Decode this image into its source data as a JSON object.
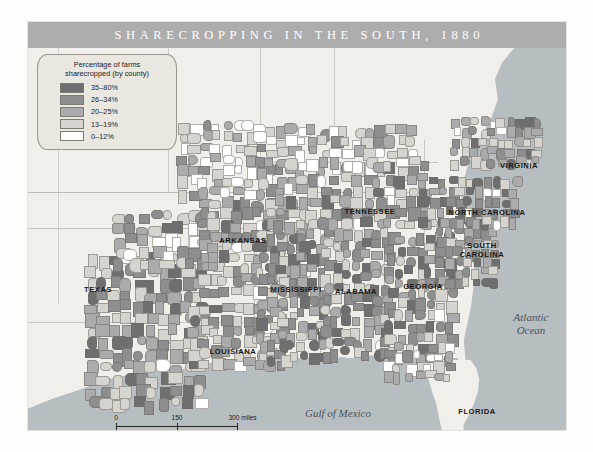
{
  "map": {
    "title": "SHARECROPPING IN THE SOUTH, 1880",
    "legend": {
      "title_line1": "Percentage of farms",
      "title_line2": "sharecropped (by county)",
      "entries": [
        {
          "label": "35–80%",
          "color": "#6f6f6f"
        },
        {
          "label": "26–34%",
          "color": "#8e8e8e"
        },
        {
          "label": "20–25%",
          "color": "#ababab"
        },
        {
          "label": "13–19%",
          "color": "#d6d4ce"
        },
        {
          "label": "0–12%",
          "color": "#ffffff"
        }
      ]
    },
    "state_labels": [
      {
        "name": "texas",
        "text": "TEXAS",
        "x": 70,
        "y": 268
      },
      {
        "name": "arkansas",
        "text": "ARKANSAS",
        "x": 215,
        "y": 219
      },
      {
        "name": "louisiana",
        "text": "LOUISIANA",
        "x": 205,
        "y": 330
      },
      {
        "name": "mississippi",
        "text": "MISSISSIPPI",
        "x": 268,
        "y": 268
      },
      {
        "name": "alabama",
        "text": "ALABAMA",
        "x": 328,
        "y": 270
      },
      {
        "name": "tennessee",
        "text": "TENNESSEE",
        "x": 342,
        "y": 190
      },
      {
        "name": "georgia",
        "text": "GEORGIA",
        "x": 395,
        "y": 265
      },
      {
        "name": "south-carolina",
        "text": "SOUTH\nCAROLINA",
        "x": 454,
        "y": 229
      },
      {
        "name": "north-carolina",
        "text": "NORTH CAROLINA",
        "x": 459,
        "y": 191
      },
      {
        "name": "virginia",
        "text": "VIRGINIA",
        "x": 491,
        "y": 144
      },
      {
        "name": "florida",
        "text": "FLORIDA",
        "x": 449,
        "y": 390
      }
    ],
    "water_labels": [
      {
        "name": "gulf-of-mexico",
        "text": "Gulf of Mexico",
        "x": 310,
        "y": 391
      },
      {
        "name": "atlantic-ocean",
        "text": "Atlantic\nOcean",
        "x": 503,
        "y": 302
      }
    ],
    "scalebar": {
      "miles": {
        "ticks": [
          "0",
          "150",
          "300 miles"
        ],
        "positions": [
          0,
          50,
          100
        ]
      },
      "kilometers": {
        "ticks": [
          "0",
          "150",
          "200 kilometers"
        ],
        "positions": [
          0,
          38,
          76
        ]
      }
    }
  }
}
